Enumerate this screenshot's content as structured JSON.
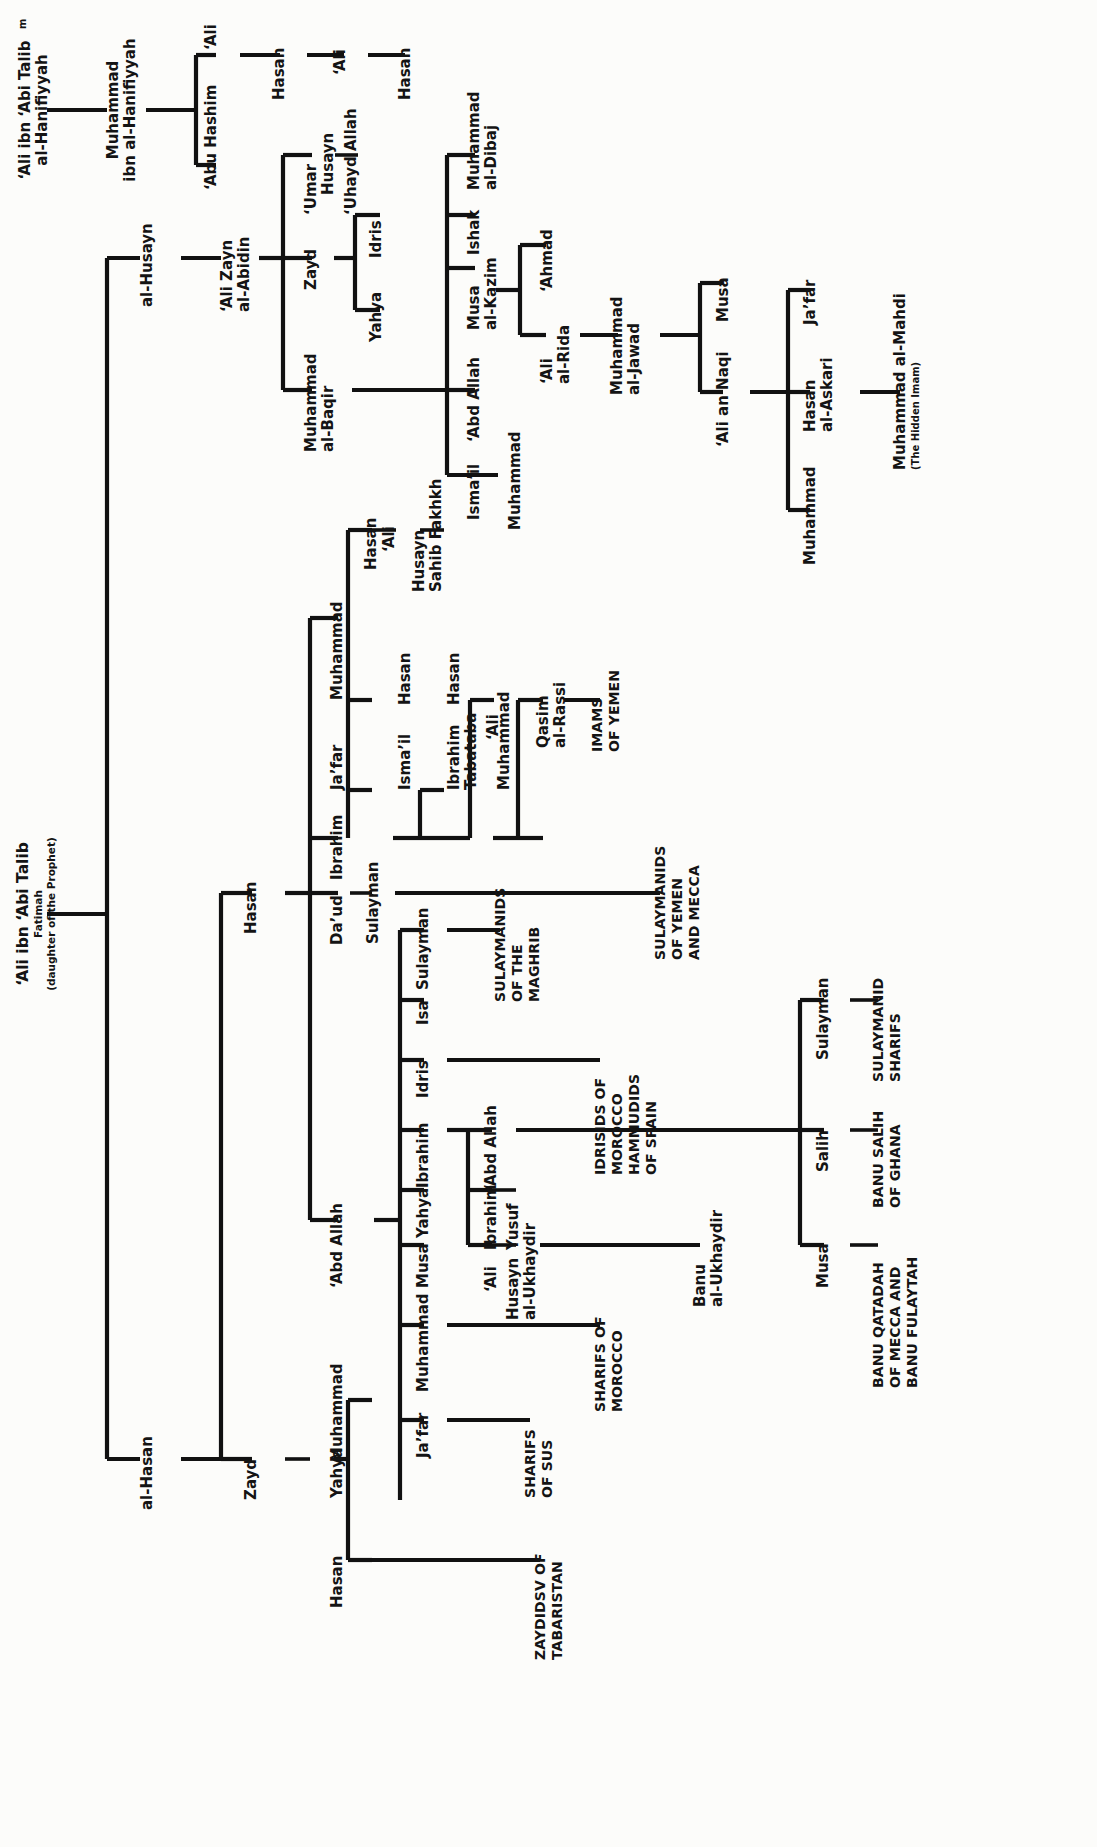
{
  "diagram": {
    "type": "family-tree",
    "orientation": "rotated-90-left",
    "line_color": "#111111",
    "text_color": "#141414",
    "background": "#fcfcfa"
  },
  "nodes": {
    "ali_root": {
      "line1": "‘Ali ibn ‘Abi Talib",
      "line2": "Fatimah",
      "line3": "(daughter of the Prophet)"
    },
    "ali_hanifiyyah": {
      "line1": "‘Ali ibn ‘Abi Talib",
      "marker": "m",
      "line2": "al-Hanifiyyah"
    },
    "muhammad_hanifiyyah": {
      "line1": "Muhammad",
      "line2": "ibn al-Hanifiyyah"
    },
    "abu_hashim": {
      "line1": "‘Abu Hashim"
    },
    "ali_h1": {
      "line1": "‘Ali"
    },
    "hasan_h1": {
      "line1": "Hasan"
    },
    "ali_h2": {
      "line1": "‘Ali"
    },
    "hasan_h2": {
      "line1": "Hasan"
    },
    "al_husayn": {
      "line1": "al-Husayn"
    },
    "al_hasan": {
      "line1": "al-Hasan"
    },
    "ali_zayn": {
      "line1": "‘Ali Zayn",
      "line2": "al-Abidin"
    },
    "umar": {
      "line1": "‘Umar"
    },
    "husayn_u": {
      "line1": "Husayn"
    },
    "uhayd_allah": {
      "line1": "‘Uhayd Allah"
    },
    "zayd": {
      "line1": "Zayd"
    },
    "yahya_z": {
      "line1": "Yahya"
    },
    "idris_z": {
      "line1": "Idris"
    },
    "muhammad_baqir": {
      "line1": "Muhammad",
      "line2": "al-Baqir"
    },
    "ismail_j": {
      "line1": "Isma’il"
    },
    "abd_allah_j": {
      "line1": "‘Abd Allah"
    },
    "musa_kazim": {
      "line1": "Musa",
      "line2": "al-Kazim"
    },
    "ishak": {
      "line1": "Ishak"
    },
    "muhammad_dibaj": {
      "line1": "Muhammad",
      "line2": "al-Dibaj"
    },
    "muhammad_i": {
      "line1": "Muhammad"
    },
    "ahmad": {
      "line1": "‘Ahmad"
    },
    "ali_rida": {
      "line1": "‘Ali",
      "line2": "al-Rida"
    },
    "muhammad_jawad": {
      "line1": "Muhammad",
      "line2": "al-Jawad"
    },
    "musa_n": {
      "line1": "Musa"
    },
    "ali_naqi": {
      "line1": "‘Ali an Naqi"
    },
    "jafar_a": {
      "line1": "Ja’far"
    },
    "hasan_askari": {
      "line1": "Hasan",
      "line2": "al-Askari"
    },
    "muhammad_a": {
      "line1": "Muhammad"
    },
    "muhammad_mahdi": {
      "line1": "Muhammad al-Mahdi",
      "line2": "(The Hidden Imam)"
    },
    "hasan_hb": {
      "line1": "Hasan"
    },
    "ali_hb": {
      "line1": "‘Ali"
    },
    "husayn_fakhkh": {
      "line1": "Husayn",
      "line2": "Sahib Fakhkh"
    },
    "muhammad_hb": {
      "line1": "Muhammad"
    },
    "jafar_hb": {
      "line1": "Ja’far"
    },
    "ibrahim_hb": {
      "line1": "Ibrahim"
    },
    "daud_hb": {
      "line1": "Da’ud"
    },
    "ismail_t": {
      "line1": "Isma’il"
    },
    "hasan_t": {
      "line1": "Hasan"
    },
    "ali_t": {
      "line1": "‘Ali"
    },
    "ibrahim_tabataba": {
      "line1": "Ibrahim",
      "line2": "Tabataba"
    },
    "hasan_tb": {
      "line1": "Hasan"
    },
    "muhammad_tb": {
      "line1": "Muhammad"
    },
    "qasim_rassi": {
      "line1": "Qasim",
      "line2": "al-Rassi"
    },
    "imams_yemen": {
      "line1": "IMAMS",
      "line2": "OF YEMEN"
    },
    "sulayman_d": {
      "line1": "Sulayman"
    },
    "sulaymanids_yemen_mecca": {
      "line1": "SULAYMANIDS",
      "line2": "OF YEMEN",
      "line3": "AND MECCA"
    },
    "hasan_mid": {
      "line1": "Hasan"
    },
    "abd_allah_hl": {
      "line1": "‘Abd Allah"
    },
    "sulayman_hl": {
      "line1": "Sulayman"
    },
    "sulaymanids_maghrib": {
      "line1": "SULAYMANIDS",
      "line2": "OF THE",
      "line3": "MAGHRIB"
    },
    "isa_hl": {
      "line1": "Isa"
    },
    "idris_hl": {
      "line1": "Idris"
    },
    "idrisids_hammudids": {
      "line1": "IDRISIDS OF",
      "line2": "MOROCCO",
      "line3": "HAMMUDIDS",
      "line4": "OF SPAIN"
    },
    "ibrahim_hl": {
      "line1": "Ibrahim"
    },
    "abd_allah_ib": {
      "line1": "‘Abd Allah"
    },
    "ibrahim_ib": {
      "line1": "Ibrahim"
    },
    "yusuf_ib": {
      "line1": "Yusuf"
    },
    "ali_ib": {
      "line1": "‘Ali"
    },
    "husayn_ukhaydir": {
      "line1": "Husayn",
      "line2": "al-Ukhaydir"
    },
    "banu_ukhaydir": {
      "line1": "Banu",
      "line2": "al-Ukhaydir"
    },
    "yahya_hl": {
      "line1": "Yahya"
    },
    "musa_hl": {
      "line1": "Musa"
    },
    "muhammad_hl": {
      "line1": "Muhammad"
    },
    "sharifs_morocco": {
      "line1": "SHARIFS OF",
      "line2": "MOROCCO"
    },
    "jafar_hl": {
      "line1": "Ja’far"
    },
    "sharifs_sus": {
      "line1": "SHARIFS",
      "line2": "OF SUS"
    },
    "zayd_hl": {
      "line1": "Zayd"
    },
    "yahya_zl": {
      "line1": "Yahya"
    },
    "muhammad_zl": {
      "line1": "Muhammad"
    },
    "hasan_zl": {
      "line1": "Hasan"
    },
    "zaydids_tabaristan": {
      "line1": "ZAYDIDSV OF",
      "line2": "TABARISTAN"
    },
    "salih": {
      "line1": "Salih"
    },
    "sulayman_s": {
      "line1": "Sulayman"
    },
    "musa_s": {
      "line1": "Musa"
    },
    "banu_salih_ghana": {
      "line1": "BANU SALIH",
      "line2": "OF GHANA"
    },
    "sulaymanid_sharifs": {
      "line1": "SULAYMANID",
      "line2": "SHARIFS"
    },
    "banu_qatadah": {
      "line1": "BANU QATADAH",
      "line2": "OF MECCA AND",
      "line3": "BANU FULAYTAH"
    }
  }
}
